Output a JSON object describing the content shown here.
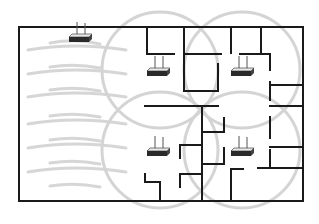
{
  "diagram": {
    "colors": {
      "background": "#ffffff",
      "wall": "#1a1a1a",
      "coverage": "#d4d4d4",
      "router_body": "#2a2a2a",
      "router_top": "#e8e8e8",
      "antenna": "#555555"
    },
    "building_outline": {
      "x": 19,
      "y": 27,
      "width": 124,
      "height": 63
    },
    "coverage_circles": [
      {
        "id": "circle-top-center",
        "cx": 160,
        "cy": 77,
        "r": 56
      },
      {
        "id": "circle-top-right",
        "cx": 243,
        "cy": 77,
        "r": 56
      },
      {
        "id": "circle-bottom-center",
        "cx": 160,
        "cy": 150,
        "r": 56
      },
      {
        "id": "circle-bottom-right",
        "cx": 243,
        "cy": 150,
        "r": 56
      }
    ],
    "routers": [
      {
        "id": "router-top-left",
        "x": 77,
        "y": 37,
        "label": "access point 1"
      },
      {
        "id": "router-top-center",
        "x": 157,
        "y": 69,
        "label": "access point 2"
      },
      {
        "id": "router-top-right",
        "x": 241,
        "y": 69,
        "label": "access point 3"
      },
      {
        "id": "router-bottom-center",
        "x": 157,
        "y": 149,
        "label": "access point 4"
      },
      {
        "id": "router-bottom-right",
        "x": 241,
        "y": 149,
        "label": "access point 5"
      }
    ],
    "signal_waves": {
      "count": 12,
      "description": "Curved gray signal lines radiating from top-left router across open area"
    }
  }
}
